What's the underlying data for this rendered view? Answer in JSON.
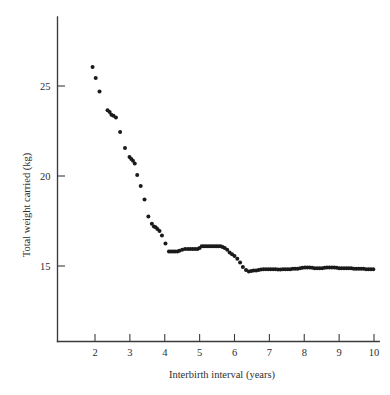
{
  "chart_data": {
    "type": "scatter",
    "title": "",
    "xlabel": "Interbirth interval (years)",
    "ylabel": "Total weight carried (kg)",
    "xlim": [
      1.35,
      10.15
    ],
    "ylim": [
      11.3,
      27.5
    ],
    "grid": false,
    "legend": null,
    "xticks": [
      2,
      3,
      4,
      5,
      6,
      7,
      8,
      9,
      10
    ],
    "xticklabels": [
      "2",
      "3",
      "4",
      "5",
      "6",
      "7",
      "8",
      "9",
      "10"
    ],
    "yticks": [
      15,
      20,
      25
    ],
    "yticklabels": [
      "15",
      "20",
      "25"
    ],
    "marker": {
      "shape": "circle",
      "size": 2.0,
      "color": "#1a1a1a"
    },
    "series": [
      {
        "name": "total weight carried",
        "x": [
          1.93,
          2.02,
          2.13,
          2.36,
          2.42,
          2.47,
          2.53,
          2.6,
          2.72,
          2.86,
          2.99,
          3.04,
          3.09,
          3.14,
          3.21,
          3.31,
          3.42,
          3.53,
          3.63,
          3.69,
          3.74,
          3.79,
          3.85,
          3.92,
          4.02,
          4.12,
          4.18,
          4.24,
          4.3,
          4.36,
          4.42,
          4.5,
          4.58,
          4.66,
          4.73,
          4.8,
          4.87,
          4.94,
          5.0,
          5.06,
          5.12,
          5.18,
          5.24,
          5.3,
          5.36,
          5.42,
          5.48,
          5.54,
          5.6,
          5.66,
          5.72,
          5.79,
          5.86,
          5.93,
          6.0,
          6.08,
          6.16,
          6.24,
          6.33,
          6.41,
          6.48,
          6.55,
          6.62,
          6.69,
          6.76,
          6.83,
          6.9,
          6.97,
          7.04,
          7.11,
          7.18,
          7.25,
          7.32,
          7.39,
          7.46,
          7.53,
          7.6,
          7.67,
          7.74,
          7.81,
          7.88,
          7.95,
          8.02,
          8.09,
          8.16,
          8.23,
          8.3,
          8.37,
          8.44,
          8.51,
          8.58,
          8.65,
          8.72,
          8.79,
          8.86,
          8.93,
          9.0,
          9.07,
          9.14,
          9.21,
          9.28,
          9.35,
          9.42,
          9.49,
          9.56,
          9.63,
          9.7,
          9.77,
          9.84,
          9.91,
          9.98
        ],
        "y": [
          26.05,
          25.45,
          24.7,
          23.65,
          23.55,
          23.4,
          23.35,
          23.25,
          22.45,
          21.55,
          21.05,
          20.95,
          20.85,
          20.7,
          20.05,
          19.45,
          18.7,
          17.75,
          17.35,
          17.2,
          17.15,
          17.05,
          16.95,
          16.7,
          16.25,
          15.8,
          15.8,
          15.8,
          15.8,
          15.8,
          15.85,
          15.9,
          15.95,
          15.95,
          15.95,
          15.95,
          15.95,
          15.95,
          16.0,
          16.1,
          16.1,
          16.1,
          16.1,
          16.1,
          16.1,
          16.1,
          16.1,
          16.1,
          16.1,
          16.05,
          16.0,
          15.9,
          15.75,
          15.65,
          15.55,
          15.4,
          15.2,
          14.95,
          14.78,
          14.7,
          14.72,
          14.75,
          14.75,
          14.78,
          14.8,
          14.82,
          14.82,
          14.82,
          14.82,
          14.82,
          14.82,
          14.8,
          14.8,
          14.82,
          14.82,
          14.82,
          14.82,
          14.85,
          14.85,
          14.85,
          14.88,
          14.9,
          14.92,
          14.92,
          14.92,
          14.9,
          14.88,
          14.88,
          14.88,
          14.88,
          14.9,
          14.92,
          14.92,
          14.92,
          14.92,
          14.9,
          14.88,
          14.88,
          14.88,
          14.88,
          14.88,
          14.88,
          14.85,
          14.85,
          14.85,
          14.85,
          14.85,
          14.82,
          14.82,
          14.82,
          14.82
        ]
      }
    ]
  }
}
